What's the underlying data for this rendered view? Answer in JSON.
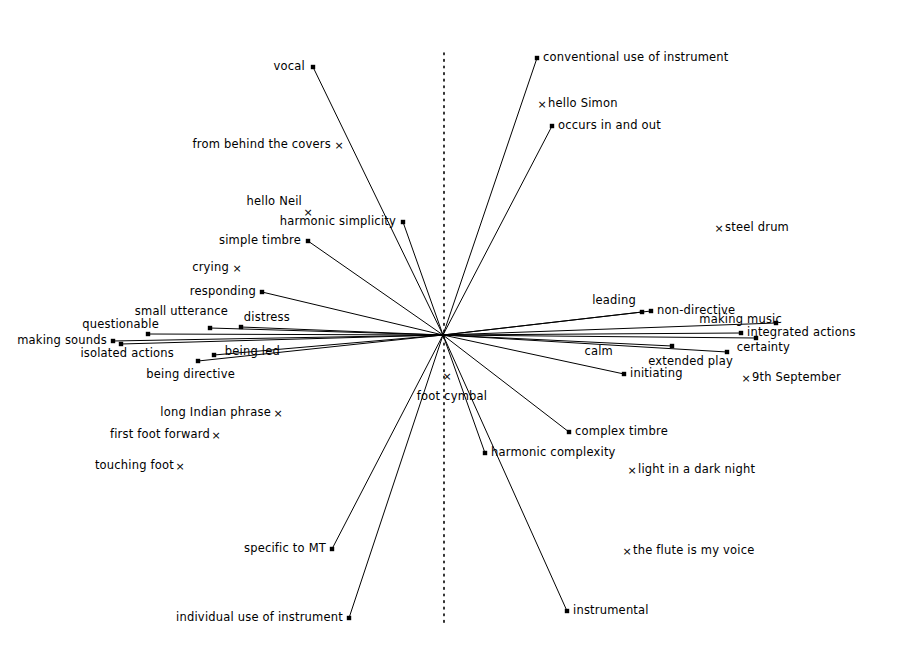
{
  "figure": {
    "type": "radial-biplot",
    "background": "#ffffff",
    "ink": "#000000",
    "width": 909,
    "height": 655,
    "origin": {
      "x": 443,
      "y": 335
    },
    "axis_line": {
      "kind": "vertical-dotted",
      "x": 444,
      "y_top": 53,
      "y_bottom": 627,
      "dash": "1.6 5"
    }
  },
  "chart_data": {
    "type": "scatter",
    "title": "",
    "subtitle": "",
    "xlabel": "",
    "ylabel": "",
    "grid": false,
    "legend": "none",
    "origin": {
      "x": 443,
      "y": 335
    },
    "marker_kinds": {
      "square": "vector endpoint (line drawn from origin)",
      "cross": "plotted point only (no line)"
    },
    "vectors": [
      {
        "label": "vocal",
        "marker": "square",
        "x": 313,
        "y": 67,
        "label_x": 305,
        "label_y": 67,
        "align": "end"
      },
      {
        "label": "conventional use of instrument",
        "marker": "square",
        "x": 537,
        "y": 58,
        "label_x": 543,
        "label_y": 58,
        "align": "start"
      },
      {
        "label": "occurs in and out",
        "marker": "square",
        "x": 552,
        "y": 126,
        "label_x": 558,
        "label_y": 126,
        "align": "start"
      },
      {
        "label": "harmonic simplicity",
        "marker": "square",
        "x": 403,
        "y": 222,
        "label_x": 396,
        "label_y": 222,
        "align": "end"
      },
      {
        "label": "simple timbre",
        "marker": "square",
        "x": 308,
        "y": 241,
        "label_x": 301,
        "label_y": 241,
        "align": "end"
      },
      {
        "label": "responding",
        "marker": "square",
        "x": 262,
        "y": 292,
        "label_x": 256,
        "label_y": 292,
        "align": "end"
      },
      {
        "label": "distress",
        "marker": "square",
        "x": 241,
        "y": 327,
        "label_x": 290,
        "label_y": 318,
        "align": "end"
      },
      {
        "label": "questionable",
        "marker": "square",
        "x": 148,
        "y": 334,
        "label_x": 159,
        "label_y": 325,
        "align": "end"
      },
      {
        "label": "small utterance",
        "marker": "square",
        "x": 210,
        "y": 328,
        "label_x": 228,
        "label_y": 312,
        "align": "end"
      },
      {
        "label": "making sounds",
        "marker": "square",
        "x": 113,
        "y": 341,
        "label_x": 107,
        "label_y": 341,
        "align": "end"
      },
      {
        "label": "isolated actions",
        "marker": "square",
        "x": 121,
        "y": 344,
        "label_x": 174,
        "label_y": 354,
        "align": "end"
      },
      {
        "label": "being led",
        "marker": "square",
        "x": 214,
        "y": 355,
        "label_x": 280,
        "label_y": 352,
        "align": "end"
      },
      {
        "label": "being directive",
        "marker": "square",
        "x": 198,
        "y": 361,
        "label_x": 235,
        "label_y": 375,
        "align": "end"
      },
      {
        "label": "leading",
        "marker": "square",
        "x": 642,
        "y": 312,
        "label_x": 636,
        "label_y": 301,
        "align": "end"
      },
      {
        "label": "non-directive",
        "marker": "square",
        "x": 651,
        "y": 311,
        "label_x": 657,
        "label_y": 311,
        "align": "start"
      },
      {
        "label": "making music",
        "marker": "square",
        "x": 776,
        "y": 323,
        "label_x": 782,
        "label_y": 320,
        "align": "end"
      },
      {
        "label": "integrated actions",
        "marker": "square",
        "x": 741,
        "y": 333,
        "label_x": 747,
        "label_y": 333,
        "align": "start"
      },
      {
        "label": "certainty",
        "marker": "square",
        "x": 756,
        "y": 338,
        "label_x": 790,
        "label_y": 348,
        "align": "end"
      },
      {
        "label": "calm",
        "marker": "square",
        "x": 672,
        "y": 346,
        "label_x": 613,
        "label_y": 352,
        "align": "end"
      },
      {
        "label": "extended play",
        "marker": "square",
        "x": 727,
        "y": 352,
        "label_x": 733,
        "label_y": 362,
        "align": "end"
      },
      {
        "label": "initiating",
        "marker": "square",
        "x": 624,
        "y": 374,
        "label_x": 630,
        "label_y": 374,
        "align": "start"
      },
      {
        "label": "complex timbre",
        "marker": "square",
        "x": 569,
        "y": 432,
        "label_x": 575,
        "label_y": 432,
        "align": "start"
      },
      {
        "label": "harmonic complexity",
        "marker": "square",
        "x": 485,
        "y": 453,
        "label_x": 491,
        "label_y": 453,
        "align": "start"
      },
      {
        "label": "instrumental",
        "marker": "square",
        "x": 567,
        "y": 611,
        "label_x": 573,
        "label_y": 611,
        "align": "start"
      },
      {
        "label": "specific to MT",
        "marker": "square",
        "x": 332,
        "y": 549,
        "label_x": 326,
        "label_y": 549,
        "align": "end"
      },
      {
        "label": "individual use of instrument",
        "marker": "square",
        "x": 349,
        "y": 618,
        "label_x": 343,
        "label_y": 618,
        "align": "end"
      }
    ],
    "points": [
      {
        "label": "from behind the covers",
        "marker": "cross",
        "x": 339,
        "y": 145,
        "label_x": 331,
        "label_y": 145,
        "align": "end"
      },
      {
        "label": "hello Simon",
        "marker": "cross",
        "x": 542,
        "y": 104,
        "label_x": 548,
        "label_y": 104,
        "align": "start"
      },
      {
        "label": "hello Neil",
        "marker": "cross",
        "x": 308,
        "y": 212,
        "label_x": 302,
        "label_y": 202,
        "align": "end"
      },
      {
        "label": "crying",
        "marker": "cross",
        "x": 237,
        "y": 268,
        "label_x": 229,
        "label_y": 268,
        "align": "end"
      },
      {
        "label": "steel drum",
        "marker": "cross",
        "x": 719,
        "y": 228,
        "label_x": 725,
        "label_y": 228,
        "align": "start"
      },
      {
        "label": "9th September",
        "marker": "cross",
        "x": 746,
        "y": 378,
        "label_x": 752,
        "label_y": 378,
        "align": "start"
      },
      {
        "label": "light in a dark night",
        "marker": "cross",
        "x": 632,
        "y": 470,
        "label_x": 638,
        "label_y": 470,
        "align": "start"
      },
      {
        "label": "long Indian phrase",
        "marker": "cross",
        "x": 278,
        "y": 413,
        "label_x": 271,
        "label_y": 413,
        "align": "end"
      },
      {
        "label": "first foot forward",
        "marker": "cross",
        "x": 216,
        "y": 435,
        "label_x": 210,
        "label_y": 435,
        "align": "end"
      },
      {
        "label": "touching foot",
        "marker": "cross",
        "x": 180,
        "y": 466,
        "label_x": 174,
        "label_y": 466,
        "align": "end"
      },
      {
        "label": "the flute is my voice",
        "marker": "cross",
        "x": 627,
        "y": 551,
        "label_x": 633,
        "label_y": 551,
        "align": "start"
      },
      {
        "label": "foot cymbal",
        "marker": "cross",
        "x": 447,
        "y": 376,
        "label_x": 452,
        "label_y": 397,
        "align": "mid"
      }
    ]
  }
}
